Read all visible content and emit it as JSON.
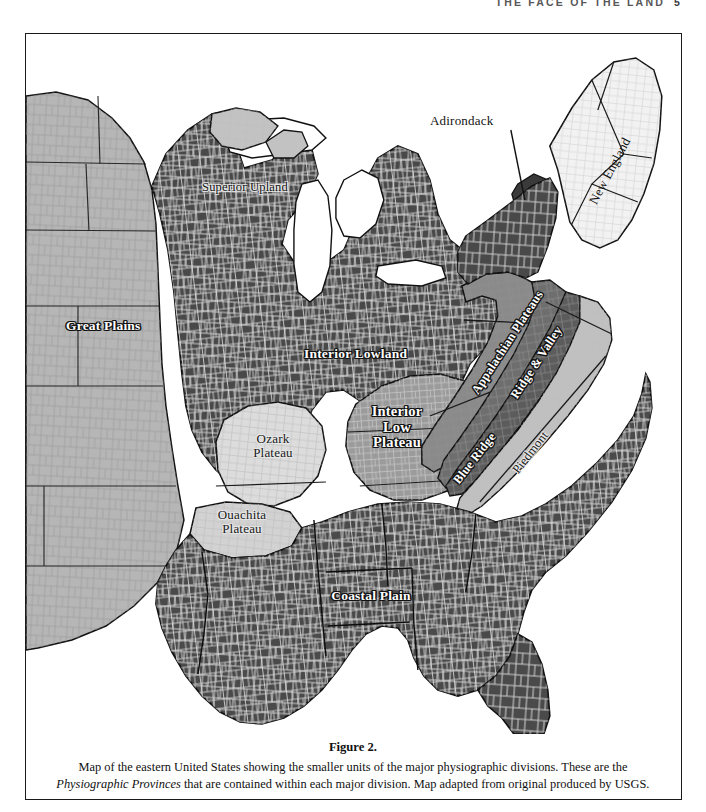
{
  "running_head": {
    "title": "THE FACE OF THE LAND",
    "folio": "5"
  },
  "figure": {
    "caption_title": "Figure 2.",
    "caption_line1": "Map of the eastern United States showing the smaller units of the major physiographic divisions. These are the",
    "caption_italic": "Physiographic Provinces",
    "caption_line2_rest": " that are contained within each major division. Map adapted from original produced by USGS."
  },
  "map": {
    "labels": [
      {
        "id": "great-plains",
        "text": "Great Plains",
        "style": "white",
        "x": 40,
        "y": 292,
        "size": 13.5,
        "rot": 0,
        "align": "left"
      },
      {
        "id": "superior-upland",
        "text": "Superior Upland",
        "style": "dark",
        "x": 178,
        "y": 153,
        "size": 12.5,
        "rot": 0,
        "align": "left"
      },
      {
        "id": "interior-lowland",
        "text": "Interior Lowland",
        "style": "white",
        "x": 298,
        "y": 320,
        "size": 13.5,
        "rot": 0,
        "align": "left"
      },
      {
        "id": "adirondack",
        "text": "Adirondack",
        "style": "plain",
        "x": 428,
        "y": 117,
        "size": 13.0,
        "rot": 0,
        "align": "left"
      },
      {
        "id": "new-england",
        "text": "New England",
        "style": "plain",
        "x": 578,
        "y": 140,
        "size": 13.0,
        "rot": -62,
        "align": "center"
      },
      {
        "id": "appalachian-plateaus",
        "text": "Appalachian Plateaus",
        "style": "white",
        "x": 482,
        "y": 318,
        "size": 12.5,
        "rot": -57,
        "align": "center"
      },
      {
        "id": "ridge-and-valley",
        "text": "Ridge & Valley",
        "style": "white",
        "x": 512,
        "y": 337,
        "size": 12.5,
        "rot": -57,
        "align": "center"
      },
      {
        "id": "blue-ridge",
        "text": "Blue Ridge",
        "style": "white",
        "x": 450,
        "y": 432,
        "size": 12.5,
        "rot": -52,
        "align": "center"
      },
      {
        "id": "piedmont",
        "text": "Piedmont",
        "style": "dark",
        "x": 505,
        "y": 426,
        "size": 12.5,
        "rot": -52,
        "align": "center"
      },
      {
        "id": "ozark-plateau",
        "text": "Ozark\nPlateau",
        "style": "dark",
        "x": 246,
        "y": 413,
        "size": 13.0,
        "rot": 0,
        "align": "center"
      },
      {
        "id": "ouachita-plateau",
        "text": "Ouachita\nPlateau",
        "style": "dark",
        "x": 216,
        "y": 489,
        "size": 13.0,
        "rot": 0,
        "align": "center"
      },
      {
        "id": "interior-low-plateau",
        "text": "Interior\nLow\nPlateau",
        "style": "white",
        "x": 371,
        "y": 401,
        "size": 14.5,
        "rot": 0,
        "align": "center"
      },
      {
        "id": "coastal-plain",
        "text": "Coastal Plain",
        "style": "white",
        "x": 345,
        "y": 562,
        "size": 13.5,
        "rot": 0,
        "align": "center"
      }
    ],
    "colors": {
      "water_background": "#ffffff",
      "great_plains": "#b6b6b6",
      "interior_lowland": "#494949",
      "superior_upland": "#c2c2c2",
      "ozark_plateau": "#dcdcdc",
      "ouachita_plateau": "#d2d2d2",
      "interior_low_plateau": "#9b9b9b",
      "appalachian_plateaus": "#8a8a8a",
      "ridge_and_valley": "#6e6e6e",
      "blue_ridge": "#5c5c5c",
      "piedmont": "#c0c0c0",
      "coastal_plain": "#4a4a4a",
      "new_england": "#f2f2f2",
      "adirondack": "#3a3a3a",
      "outline": "#111111",
      "county_line_light": "#e6e6e6",
      "county_line_dark": "#6a6a6a"
    }
  }
}
